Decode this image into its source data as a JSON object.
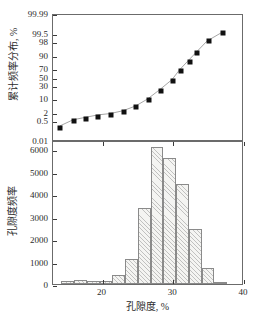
{
  "figure": {
    "background": "#ffffff",
    "frame_color": "#6b6b6b",
    "marker_color": "#111111",
    "bar_fill": "#f4f4f2",
    "bar_edge": "#8a8a8a"
  },
  "top_panel": {
    "axis_title": "累计频率分布, %",
    "y_tick_labels": [
      "99.99",
      "99.5",
      "98",
      "90",
      "70",
      "50",
      "30",
      "10",
      "2",
      "0.5",
      "0.01"
    ]
  },
  "bottom_panel": {
    "axis_title": "孔隙度频率",
    "y_tick_labels": [
      "6000",
      "5000",
      "4000",
      "3000",
      "2000",
      "1000",
      "0"
    ],
    "x_tick_labels": [
      "20",
      "30",
      "40"
    ],
    "x_axis_title": "孔隙度, %"
  },
  "chart_data": [
    {
      "type": "scatter",
      "title": "",
      "subtitle": "",
      "xlabel": "孔隙度, %",
      "ylabel": "累计频率分布, %",
      "xlim": [
        13,
        40
      ],
      "ylim_probability_scale": [
        0.01,
        99.99
      ],
      "y_scale": "normal-probability",
      "y_tick_values": [
        99.99,
        99.5,
        98,
        90,
        70,
        50,
        30,
        10,
        2,
        0.5,
        0.01
      ],
      "grid": false,
      "legend": "none",
      "marker": "filled-square",
      "line": "solid-thin-gray",
      "series": [
        {
          "name": "累计频率分布",
          "x": [
            14.0,
            15.9,
            17.7,
            19.4,
            21.2,
            23.0,
            24.8,
            26.5,
            28.3,
            30.0,
            31.1,
            32.3,
            33.4,
            35.0,
            37.0
          ],
          "y": [
            0.2,
            0.6,
            0.9,
            1.3,
            1.6,
            2.4,
            4.5,
            10.0,
            24.0,
            45.0,
            68.0,
            84.0,
            93.0,
            98.5,
            99.6
          ]
        }
      ]
    },
    {
      "type": "bar",
      "title": "",
      "xlabel": "孔隙度, %",
      "ylabel": "孔隙度频率",
      "xlim": [
        13,
        40
      ],
      "ylim": [
        0,
        6400
      ],
      "y_tick_values": [
        0,
        1000,
        2000,
        3000,
        4000,
        5000,
        6000
      ],
      "x_tick_values": [
        20,
        30,
        40
      ],
      "grid": false,
      "legend": "none",
      "bin_width": 1.8,
      "bin_left_edges": [
        14.2,
        16.0,
        17.8,
        19.6,
        21.4,
        23.2,
        25.0,
        26.8,
        28.6,
        30.4,
        32.2,
        34.0,
        35.8,
        37.6
      ],
      "bin_centers": [
        15.1,
        16.9,
        18.7,
        20.5,
        22.3,
        24.1,
        25.9,
        27.7,
        29.5,
        31.3,
        33.1,
        34.9,
        36.7,
        38.5
      ],
      "values": [
        150,
        185,
        140,
        150,
        410,
        1130,
        3370,
        6080,
        5610,
        4460,
        2460,
        690,
        60,
        0
      ]
    }
  ]
}
